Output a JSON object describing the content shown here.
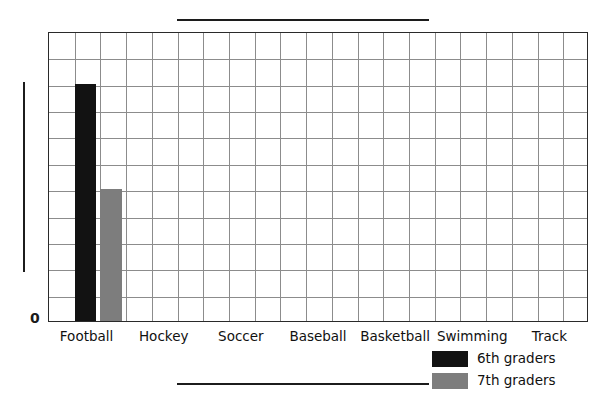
{
  "chart_data": {
    "type": "bar",
    "title": "",
    "title_redacted": true,
    "xlabel": "",
    "xlabel_redacted": true,
    "ylabel": "",
    "ylabel_redacted": true,
    "categories": [
      "Football",
      "Hockey",
      "Soccer",
      "Baseball",
      "Basketball",
      "Swimming",
      "Track"
    ],
    "series": [
      {
        "name": "6th graders",
        "color": "#121212",
        "values": [
          9,
          0,
          0,
          0,
          0,
          0,
          0
        ]
      },
      {
        "name": "7th graders",
        "color": "#7d7d7d",
        "values": [
          5,
          0,
          0,
          0,
          0,
          0,
          0
        ]
      }
    ],
    "ylim": [
      0,
      11
    ],
    "y_tick_labels": [
      "0"
    ],
    "grid": true,
    "grid_rows": 11,
    "grid_cols": 21,
    "legend_position": "bottom-right",
    "legend_entries": [
      {
        "label": "6th graders",
        "color": "#121212"
      },
      {
        "label": "7th graders",
        "color": "#7d7d7d"
      }
    ]
  },
  "axis": {
    "zero_label": "0"
  },
  "legend": {
    "items": [
      {
        "label": "6th graders"
      },
      {
        "label": "7th graders"
      }
    ]
  },
  "colors": {
    "sixth_graders": "#121212",
    "seventh_graders": "#7d7d7d",
    "grid_line": "#8c8c8c",
    "plot_border": "#2a2a2a",
    "redaction": "#1c1c1c",
    "background": "#ffffff"
  }
}
